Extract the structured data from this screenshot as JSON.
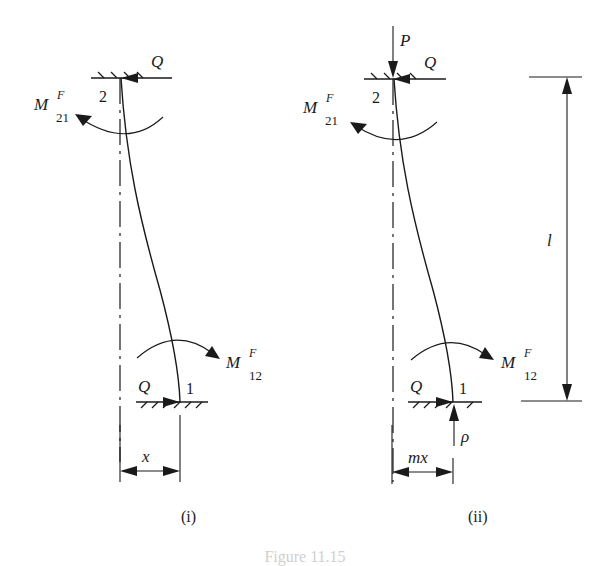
{
  "figure": {
    "caption": "Figure 11.15",
    "panels": [
      {
        "id": "i",
        "label": "(i)",
        "top_node": "2",
        "bottom_node": "1",
        "top_force": "Q",
        "bottom_force": "Q",
        "top_moment": {
          "base": "M",
          "sup": "F",
          "sub": "21"
        },
        "bottom_moment": {
          "base": "M",
          "sup": "F",
          "sub": "12"
        },
        "offset_label": "x"
      },
      {
        "id": "ii",
        "label": "(ii)",
        "top_node": "2",
        "bottom_node": "1",
        "axial_top": "P",
        "axial_bottom": "ρ",
        "top_force": "Q",
        "bottom_force": "Q",
        "top_moment": {
          "base": "M",
          "sup": "F",
          "sub": "21"
        },
        "bottom_moment": {
          "base": "M",
          "sup": "F",
          "sub": "12"
        },
        "offset_label": "mx",
        "length_label": "l"
      }
    ],
    "colors": {
      "ink": "#1a1a1a",
      "background": "#ffffff"
    }
  }
}
